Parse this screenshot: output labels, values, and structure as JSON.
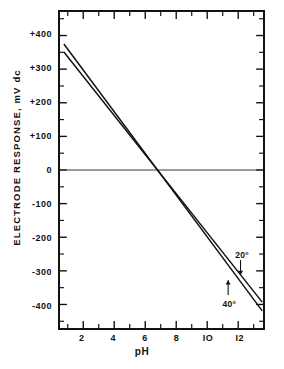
{
  "chart_data": {
    "type": "line",
    "title": "",
    "xlabel": "pH",
    "ylabel": "ELECTRODE  RESPONSE,  mV  dc",
    "xlim": [
      0.5,
      13.6
    ],
    "ylim": [
      -470,
      470
    ],
    "grid": false,
    "legend_position": "inline-annotations",
    "x_major_ticks": [
      2,
      4,
      6,
      8,
      10,
      12
    ],
    "x_minor_ticks": [
      1,
      3,
      5,
      7,
      9,
      11,
      13
    ],
    "x_tick_labels": [
      "2",
      "4",
      "6",
      "8",
      "IO",
      "I2"
    ],
    "y_major_ticks": [
      400,
      300,
      200,
      100,
      0,
      -100,
      -200,
      -300,
      -400
    ],
    "y_minor_ticks": [
      450,
      350,
      250,
      150,
      50,
      -50,
      -150,
      -250,
      -350,
      -450
    ],
    "y_tick_labels": [
      "+400",
      "+300",
      "+200",
      "+100",
      "0",
      "-100",
      "-200",
      "-300",
      "-400"
    ],
    "zero_reference_line": 0,
    "series": [
      {
        "name": "20°",
        "label": "20°",
        "slope_mv_per_ph": -58.2,
        "isopotential_ph": 6.8,
        "x": [
          0.75,
          13.55
        ],
        "values": [
          351,
          -393
        ],
        "annotation": {
          "text": "20°",
          "arrow": "down",
          "x": 12.15,
          "y": -268
        }
      },
      {
        "name": "40°",
        "label": "40°",
        "slope_mv_per_ph": -62.1,
        "isopotential_ph": 6.8,
        "x": [
          0.75,
          13.55
        ],
        "values": [
          375,
          -419
        ],
        "annotation": {
          "text": "40°",
          "arrow": "up",
          "x": 11.35,
          "y": -372
        }
      }
    ]
  },
  "axes": {
    "x_title": "pH",
    "y_title": "ELECTRODE  RESPONSE,  mV  dc"
  }
}
